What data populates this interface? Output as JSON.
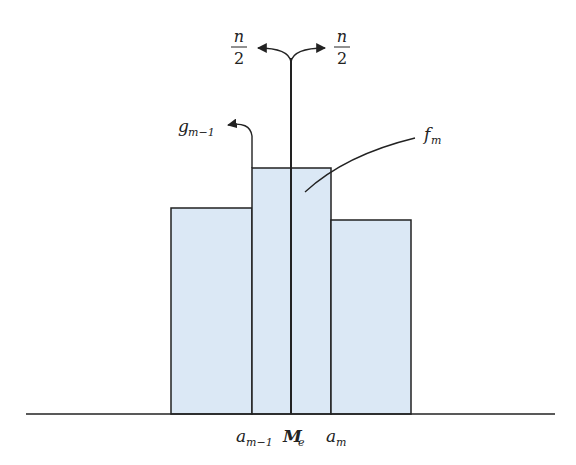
{
  "diagram": {
    "colors": {
      "bar_fill": "#dbe8f5",
      "stroke": "#222222",
      "background": "#ffffff"
    },
    "bars": [
      {
        "name": "class-before-median",
        "x0": 171,
        "x1": 252,
        "top": 208
      },
      {
        "name": "median-class",
        "x0": 252,
        "x1": 331,
        "top": 168
      },
      {
        "name": "class-after-median",
        "x0": 331,
        "x1": 411,
        "top": 220
      }
    ],
    "baseline_y": 414,
    "median_x": 291,
    "labels": {
      "n_numerator": "n",
      "n_denominator": "2",
      "g_base": "g",
      "g_sub": "m−1",
      "f_base": "f",
      "f_sub": "m",
      "a_prev_base": "a",
      "a_prev_sub": "m−1",
      "median_base": "M",
      "median_sub": "e",
      "a_base": "a",
      "a_sub": "m"
    }
  }
}
